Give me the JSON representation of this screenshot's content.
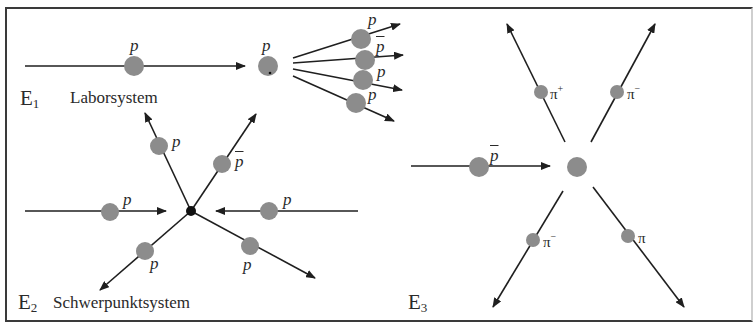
{
  "figure": {
    "colors": {
      "line": "#1f1f1f",
      "particle": "#8c8c8c",
      "vertex": "#111111",
      "frame": "#3a3a3a"
    }
  },
  "panels": {
    "e1": {
      "id_label": "E",
      "id_sub": "1",
      "system_label": "Laborsystem",
      "incoming_label": "p",
      "target_label": "p",
      "outgoing_labels": [
        "p",
        "p",
        "p",
        "p"
      ],
      "outgoing_bars": [
        false,
        true,
        false,
        false
      ]
    },
    "e2": {
      "id_label": "E",
      "id_sub": "2",
      "system_label": "Schwerpunktsystem",
      "incoming_left_label": "p",
      "incoming_right_label": "p",
      "out_upper_left_label": "p",
      "out_upper_right_label": "p",
      "out_lower_left_label": "p",
      "out_lower_right_label": "p"
    },
    "e3": {
      "id_label": "E",
      "id_sub": "3",
      "incoming_label": "p",
      "out_upper_left": {
        "symbol": "π",
        "charge": "+"
      },
      "out_upper_right": {
        "symbol": "π",
        "charge": "−"
      },
      "out_lower_left": {
        "symbol": "π",
        "charge": "−"
      },
      "out_lower_right": {
        "symbol": "π",
        "charge": ""
      }
    }
  }
}
